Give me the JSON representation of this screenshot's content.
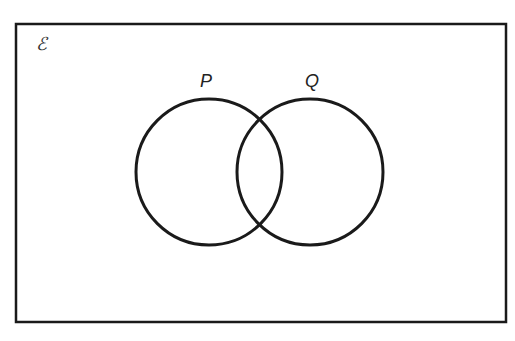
{
  "diagram": {
    "type": "venn",
    "universal_set": {
      "symbol": "ℰ",
      "rect": {
        "x": 16,
        "y": 24,
        "width": 490,
        "height": 298
      }
    },
    "sets": [
      {
        "name": "P",
        "label": "P",
        "cx": 209,
        "cy": 172,
        "r": 73
      },
      {
        "name": "Q",
        "label": "Q",
        "cx": 310,
        "cy": 172,
        "r": 73
      }
    ],
    "stroke_color": "#1a1a1a",
    "background": "#ffffff"
  }
}
